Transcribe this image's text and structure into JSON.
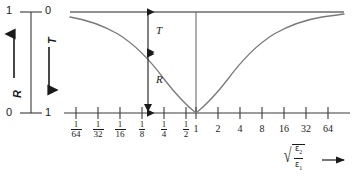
{
  "figure": {
    "line_color": "#555555",
    "axis_color": "#3a3a3a",
    "text_color": "#1a1a1a"
  },
  "legend_axis": {
    "top_left_value": "1",
    "top_right_value": "0",
    "bottom_left_value": "0",
    "bottom_right_value": "1",
    "left_label": "R",
    "right_label": "T",
    "left_arrow": "up-arrow-icon",
    "right_arrow": "down-arrow-icon"
  },
  "plot_annotations": {
    "transmittance_label": "T",
    "reflectance_label": "R",
    "marker_arrow": "down-arrow-marker-icon"
  },
  "x_axis": {
    "label_parts": {
      "radical": "√",
      "numerator": "ε",
      "numerator_sub": "2",
      "denominator": "ε",
      "denominator_sub": "1"
    },
    "label_text": "sqrt(eps2/eps1)",
    "arrow": "right-arrow-icon",
    "ticks": [
      {
        "display": "1/64",
        "num": "1",
        "den": "64",
        "is_fraction": true,
        "value": 0.015625
      },
      {
        "display": "1/32",
        "num": "1",
        "den": "32",
        "is_fraction": true,
        "value": 0.03125
      },
      {
        "display": "1/16",
        "num": "1",
        "den": "16",
        "is_fraction": true,
        "value": 0.0625
      },
      {
        "display": "1/8",
        "num": "1",
        "den": "8",
        "is_fraction": true,
        "value": 0.125
      },
      {
        "display": "1/4",
        "num": "1",
        "den": "4",
        "is_fraction": true,
        "value": 0.25
      },
      {
        "display": "1/2",
        "num": "1",
        "den": "2",
        "is_fraction": true,
        "value": 0.5
      },
      {
        "display": "1",
        "num": "1",
        "den": "",
        "is_fraction": false,
        "value": 1
      },
      {
        "display": "2",
        "num": "2",
        "den": "",
        "is_fraction": false,
        "value": 2
      },
      {
        "display": "4",
        "num": "4",
        "den": "",
        "is_fraction": false,
        "value": 4
      },
      {
        "display": "8",
        "num": "8",
        "den": "",
        "is_fraction": false,
        "value": 8
      },
      {
        "display": "16",
        "num": "16",
        "den": "",
        "is_fraction": false,
        "value": 16
      },
      {
        "display": "32",
        "num": "32",
        "den": "",
        "is_fraction": false,
        "value": 32
      },
      {
        "display": "64",
        "num": "64",
        "den": "",
        "is_fraction": false,
        "value": 64
      }
    ]
  },
  "chart_data": {
    "type": "line",
    "title": "",
    "xlabel": "sqrt(eps2/eps1)",
    "ylabel": "R (up, 0 to 1) / T (down, 0 to 1)",
    "grid": false,
    "legend": "none",
    "x_scale": "log2",
    "xlim": [
      0.015625,
      64
    ],
    "ylim": [
      0,
      1
    ],
    "x_tick_labels": [
      "1/64",
      "1/32",
      "1/16",
      "1/8",
      "1/4",
      "1/2",
      "1",
      "2",
      "4",
      "8",
      "16",
      "32",
      "64"
    ],
    "y_tick_labels_left": [
      "1",
      "0"
    ],
    "y_tick_labels_right": [
      "0",
      "1"
    ],
    "annotations": [
      {
        "text": "T",
        "at_x": 0.125,
        "span_y": [
          0.0,
          0.36
        ],
        "type": "double-arrow"
      },
      {
        "text": "R",
        "at_x": 0.125,
        "span_y": [
          0.36,
          1.0
        ],
        "type": "double-arrow"
      }
    ],
    "series": [
      {
        "name": "R (reflectance, plotted downward)",
        "x": [
          0.015625,
          0.03125,
          0.0625,
          0.125,
          0.25,
          0.5,
          1,
          2,
          4,
          8,
          16,
          32,
          64
        ],
        "values": [
          0.94,
          0.88,
          0.78,
          0.64,
          0.44,
          0.2,
          0.0,
          0.2,
          0.44,
          0.64,
          0.78,
          0.88,
          0.94
        ]
      }
    ]
  }
}
